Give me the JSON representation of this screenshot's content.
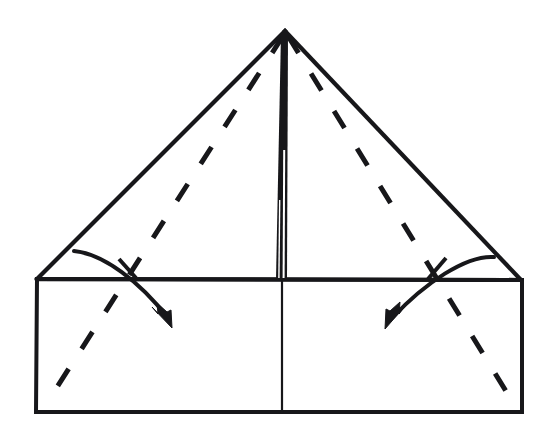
{
  "figure": {
    "kind": "origami-fold-diagram",
    "background_color": "#ffffff",
    "ink_color": "#17171a",
    "canvas": {
      "width": 553,
      "height": 446
    }
  },
  "geometry": {
    "apex": {
      "x": 285,
      "y": 31
    },
    "triangle_left_vertex": {
      "x": 37,
      "y": 279
    },
    "triangle_right_vertex": {
      "x": 521,
      "y": 280
    },
    "rect_left": 37,
    "rect_right": 522,
    "rect_top": 279,
    "rect_bottom": 412,
    "center_x": 282,
    "stroke_width_outline": 4,
    "stroke_width_center_divider": 2.2,
    "stroke_width_dashed": 5,
    "dash_pattern": "20 24",
    "stroke_width_arrow": 4,
    "stroke_width_tick": 4
  },
  "elements": {
    "paper_outline": {
      "name": "paper-outline",
      "description": "Outer silhouette: triangular flap above a rectangular body",
      "path": "M 37 279 L 285 31 L 521 280 L 522 412 L 36 412 Z"
    },
    "triangle_left_edge": {
      "name": "triangle-left-edge",
      "path": "M 37 279 L 285 31"
    },
    "triangle_right_edge": {
      "name": "triangle-right-edge",
      "path": "M 285 31 L 521 280"
    },
    "horizontal_fold_edge": {
      "name": "horizontal-fold-edge",
      "path": "M 37 279 L 521 280"
    },
    "rectangle_body": {
      "name": "rectangle-body",
      "path": "M 37 279 L 522 280 L 522 412 L 36 412 Z"
    },
    "center_vertical_divider": {
      "name": "center-vertical-divider",
      "path": "M 282 280 L 282 412"
    },
    "center_crease_band": {
      "name": "center-crease-band",
      "description": "Thick dark vertical crease from apex down to the horizontal fold edge, tapering into thin split lines",
      "outer_path": "M 281 33 L 288 33 L 287 279 L 276 279 Z",
      "sliver_path": "M 283.2 150 L 285.2 150 L 284.6 278 L 282.6 278 Z",
      "sliver2_path": "M 279.0 200 L 280.4 200 L 279.6 278 L 278.2 278 Z"
    },
    "dashed_fold_left": {
      "name": "dashed-fold-line-left",
      "description": "Valley fold crease from apex down-left to lower-left corner area",
      "path": "M 283 36 L 48 401"
    },
    "dashed_fold_right": {
      "name": "dashed-fold-line-right",
      "description": "Valley fold crease from apex down-right to lower-right corner area",
      "path": "M 288 36 L 512 401"
    },
    "arrow_left": {
      "name": "fold-arrow-left",
      "description": "Curved arrow showing left flap folding down and to the right",
      "curve_path": "M 74 251 C 104 254 140 282 168 318",
      "head_points": "172,328 152,307 158,314 157,303 167,312 171,310",
      "tick_path": "M 119 259 L 136 278"
    },
    "arrow_right": {
      "name": "fold-arrow-right",
      "description": "Curved arrow showing right flap folding down and to the left",
      "curve_path": "M 494 257 C 466 255 425 283 392 318",
      "head_points": "385,329 405,306 399,314 400,302 390,311 386,309",
      "tick_path": "M 446 258 L 428 279"
    }
  },
  "legend": {
    "solid_line_meaning": "paper edge",
    "dashed_line_meaning": "valley fold crease",
    "arrow_meaning": "fold direction"
  }
}
